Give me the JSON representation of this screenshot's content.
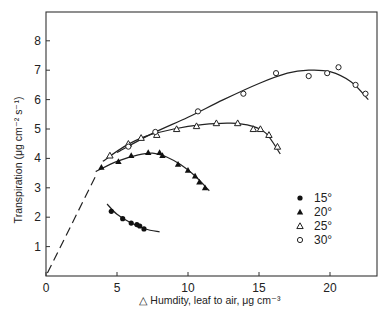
{
  "chart_data": {
    "type": "scatter",
    "title": "",
    "xlabel": "△ Humdity, leaf to air, μg cm⁻³",
    "ylabel": "Transpiration (μg cm⁻² s⁻¹)",
    "xlim": [
      0,
      23
    ],
    "ylim": [
      0,
      8.8
    ],
    "x_ticks": [
      0,
      5,
      10,
      15,
      20
    ],
    "y_ticks": [
      1,
      2,
      3,
      4,
      5,
      6,
      7,
      8
    ],
    "grid": false,
    "legend_position": "right-center inside plot",
    "series": [
      {
        "name": "15°",
        "marker": "filled-circle",
        "points": [
          [
            4.6,
            2.2
          ],
          [
            5.4,
            1.95
          ],
          [
            6.0,
            1.8
          ],
          [
            6.4,
            1.75
          ],
          [
            6.6,
            1.7
          ],
          [
            6.9,
            1.6
          ]
        ],
        "fit_curve": [
          [
            4.3,
            2.45
          ],
          [
            5.0,
            2.1
          ],
          [
            6.0,
            1.8
          ],
          [
            7.0,
            1.6
          ],
          [
            8.0,
            1.5
          ]
        ],
        "fit_style": "solid (dashed at left end)"
      },
      {
        "name": "20°",
        "marker": "filled-triangle",
        "points": [
          [
            3.9,
            3.7
          ],
          [
            5.1,
            3.9
          ],
          [
            6.0,
            4.1
          ],
          [
            7.2,
            4.2
          ],
          [
            8.0,
            4.2
          ],
          [
            8.2,
            4.1
          ],
          [
            9.3,
            3.8
          ],
          [
            10.0,
            3.6
          ],
          [
            10.5,
            3.4
          ],
          [
            10.8,
            3.2
          ],
          [
            11.2,
            3.0
          ]
        ],
        "fit_curve": [
          [
            3.5,
            3.55
          ],
          [
            5.0,
            3.9
          ],
          [
            6.5,
            4.12
          ],
          [
            7.5,
            4.18
          ],
          [
            8.5,
            4.05
          ],
          [
            9.5,
            3.78
          ],
          [
            10.5,
            3.4
          ],
          [
            11.5,
            2.9
          ]
        ],
        "fit_style": "solid"
      },
      {
        "name": "25°",
        "marker": "open-triangle",
        "points": [
          [
            4.5,
            4.1
          ],
          [
            5.8,
            4.5
          ],
          [
            6.7,
            4.7
          ],
          [
            7.8,
            4.8
          ],
          [
            9.2,
            5.0
          ],
          [
            10.6,
            5.1
          ],
          [
            12.0,
            5.2
          ],
          [
            13.5,
            5.2
          ],
          [
            14.6,
            5.0
          ],
          [
            15.1,
            5.0
          ],
          [
            15.7,
            4.8
          ],
          [
            16.3,
            4.4
          ]
        ],
        "fit_curve": [
          [
            4.0,
            3.9
          ],
          [
            5.5,
            4.4
          ],
          [
            7.0,
            4.75
          ],
          [
            9.0,
            5.0
          ],
          [
            11.0,
            5.15
          ],
          [
            13.0,
            5.2
          ],
          [
            14.5,
            5.1
          ],
          [
            15.5,
            4.85
          ],
          [
            16.5,
            4.15
          ]
        ],
        "fit_style": "solid"
      },
      {
        "name": "30°",
        "marker": "open-circle",
        "points": [
          [
            5.8,
            4.4
          ],
          [
            7.7,
            4.9
          ],
          [
            10.7,
            5.6
          ],
          [
            13.9,
            6.2
          ],
          [
            16.2,
            6.9
          ],
          [
            18.5,
            6.8
          ],
          [
            19.8,
            6.9
          ],
          [
            20.6,
            7.1
          ],
          [
            21.8,
            6.5
          ],
          [
            22.5,
            6.2
          ]
        ],
        "fit_curve": [
          [
            5.0,
            4.2
          ],
          [
            7.5,
            4.85
          ],
          [
            10.0,
            5.4
          ],
          [
            12.5,
            6.0
          ],
          [
            15.0,
            6.55
          ],
          [
            17.0,
            6.9
          ],
          [
            18.5,
            7.0
          ],
          [
            20.0,
            6.95
          ],
          [
            21.5,
            6.6
          ],
          [
            22.7,
            6.0
          ]
        ],
        "fit_style": "solid"
      }
    ],
    "extrapolation_line": {
      "style": "dashed",
      "points": [
        [
          0.1,
          0.1
        ],
        [
          3.6,
          3.5
        ]
      ]
    }
  }
}
